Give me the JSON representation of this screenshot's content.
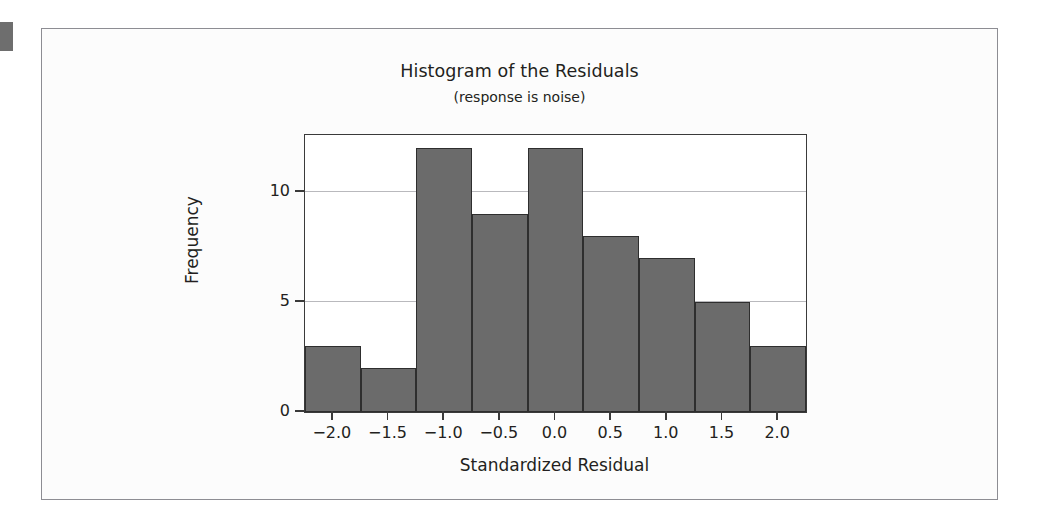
{
  "figure": {
    "title": "Histogram of the Residuals",
    "subtitle": "(response is noise)",
    "background_color": "#fcfcfc",
    "border_color": "#8d8d93"
  },
  "colors": {
    "bar_fill": "#6b6b6b",
    "bar_edge": "#2e2e2e",
    "axis": "#3a3a3a",
    "gridline": "#b9b9bd",
    "text": "#231f20"
  },
  "chart_data": {
    "type": "bar",
    "title": "Histogram of the Residuals",
    "subtitle": "(response is noise)",
    "xlabel": "Standardized Residual",
    "ylabel": "Frequency",
    "grid": true,
    "legend": "none",
    "xlim": [
      -2.25,
      2.25
    ],
    "ylim": [
      0,
      12.6
    ],
    "xticks": [
      -2.0,
      -1.5,
      -1.0,
      -0.5,
      0.0,
      0.5,
      1.0,
      1.5,
      2.0
    ],
    "xtick_labels": [
      "−2.0",
      "−1.5",
      "−1.0",
      "−0.5",
      "0.0",
      "0.5",
      "1.0",
      "1.5",
      "2.0"
    ],
    "yticks": [
      0,
      5,
      10
    ],
    "ytick_labels": [
      "0",
      "5",
      "10"
    ],
    "bin_width": 0.5,
    "bin_edges": [
      -2.25,
      -1.75,
      -1.25,
      -0.75,
      -0.25,
      0.25,
      0.75,
      1.25,
      1.75,
      2.25
    ],
    "bin_centers": [
      -2.0,
      -1.5,
      -1.0,
      -0.5,
      0.0,
      0.5,
      1.0,
      1.5,
      2.0
    ],
    "categories": [
      "-2.0",
      "-1.5",
      "-1.0",
      "-0.5",
      "0.0",
      "0.5",
      "1.0",
      "1.5",
      "2.0"
    ],
    "values": [
      3,
      2,
      12,
      9,
      12,
      8,
      7,
      5,
      3
    ],
    "total_count": 61
  }
}
